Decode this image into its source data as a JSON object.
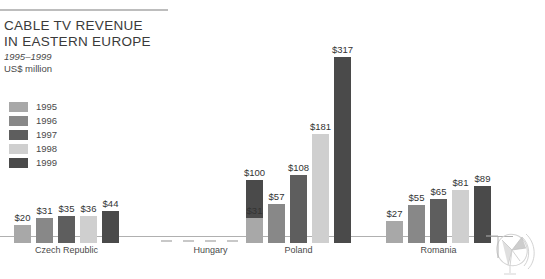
{
  "header": {
    "title_line1": "CABLE TV REVENUE",
    "title_line2": "IN EASTERN EUROPE",
    "subtitle_years": "1995–1999",
    "subtitle_units": "US$ million"
  },
  "legend": {
    "items": [
      {
        "label": "1995",
        "color": "#a8a8a8"
      },
      {
        "label": "1996",
        "color": "#888888"
      },
      {
        "label": "1997",
        "color": "#5e5e5e"
      },
      {
        "label": "1998",
        "color": "#cfcfcf"
      },
      {
        "label": "1999",
        "color": "#4a4a4a"
      }
    ]
  },
  "icons": {
    "satellite_dish": "satellite-dish-icon"
  },
  "chart_data": {
    "type": "bar",
    "title": "CABLE TV REVENUE IN EASTERN EUROPE",
    "subtitle": "1995–1999",
    "ylabel": "US$ million",
    "xlabel": "",
    "categories": [
      "Czech Republic",
      "Hungary",
      "Poland",
      "Romania"
    ],
    "series": [
      {
        "name": "1995",
        "color": "#a8a8a8",
        "values": [
          20,
          0,
          31,
          27
        ]
      },
      {
        "name": "1996",
        "color": "#888888",
        "values": [
          31,
          0,
          57,
          55
        ]
      },
      {
        "name": "1997",
        "color": "#5e5e5e",
        "values": [
          35,
          0,
          108,
          65
        ]
      },
      {
        "name": "1998",
        "color": "#cfcfcf",
        "values": [
          36,
          0,
          181,
          81
        ]
      },
      {
        "name": "1999",
        "color": "#4a4a4a",
        "values": [
          44,
          100,
          317,
          89
        ]
      }
    ],
    "value_labels": [
      [
        "$20",
        "$31",
        "$35",
        "$36",
        "$44"
      ],
      [
        "",
        "",
        "",
        "",
        "$100"
      ],
      [
        "$31",
        "$57",
        "$108",
        "$181",
        "$317"
      ],
      [
        "$27",
        "$55",
        "$65",
        "$81",
        "$89"
      ]
    ],
    "ylim": [
      0,
      330
    ],
    "grid": false,
    "legend_position": "left"
  }
}
